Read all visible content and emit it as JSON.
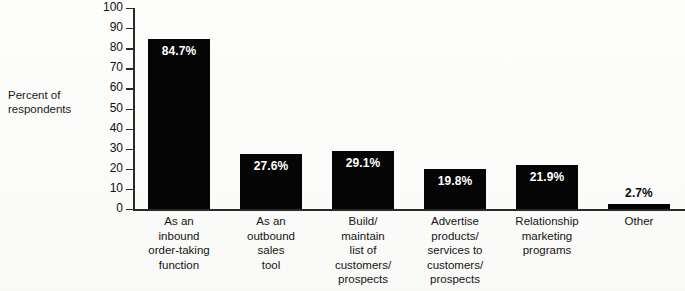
{
  "chart_data": {
    "type": "bar",
    "title": "",
    "xlabel": "",
    "ylabel": "Percent of respondents",
    "ylim": [
      0,
      100
    ],
    "ytick_step": 10,
    "yticks": [
      100,
      90,
      80,
      70,
      60,
      50,
      40,
      30,
      20,
      10,
      0
    ],
    "grid": false,
    "legend": null,
    "categories": [
      "As an inbound order-taking function",
      "As an outbound sales tool",
      "Build/ maintain list of customers/ prospects",
      "Advertise products/ services to customers/ prospects",
      "Relationship marketing programs",
      "Other"
    ],
    "category_lines": [
      [
        "As an",
        "inbound",
        "order-taking",
        "function"
      ],
      [
        "As an",
        "outbound",
        "sales",
        "tool"
      ],
      [
        "Build/",
        "maintain",
        "list of",
        "customers/",
        "prospects"
      ],
      [
        "Advertise",
        "products/",
        "services to",
        "customers/",
        "prospects"
      ],
      [
        "Relationship",
        "marketing",
        "programs"
      ],
      [
        "Other"
      ]
    ],
    "values": [
      84.7,
      27.6,
      29.1,
      19.8,
      21.9,
      2.7
    ],
    "value_labels": [
      "84.7%",
      "27.6%",
      "29.1%",
      "19.8%",
      "21.9%",
      "2.7%"
    ],
    "bar_color": "#050505",
    "label_inside_color": "#ffffff",
    "label_outside_color": "#0b0b0b",
    "axis_color": "#2a2a2a",
    "background_color": "#fdfdfb"
  },
  "axis": {
    "y_title_line1": "Percent of",
    "y_title_line2": "respondents"
  }
}
